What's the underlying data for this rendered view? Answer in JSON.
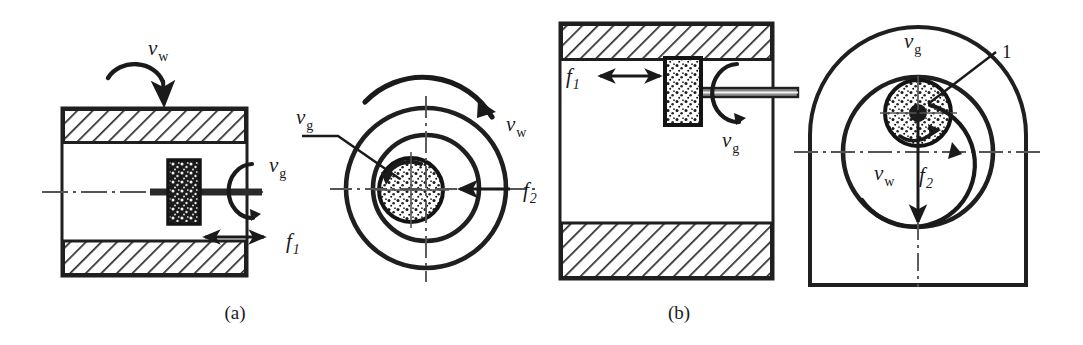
{
  "figure": {
    "colors": {
      "ink": "#1a1a1a",
      "line": "#222222",
      "hatch": "#2b2b2b",
      "background": "#ffffff",
      "centerline": "#555555",
      "grit": "#111111"
    }
  },
  "panel_a": {
    "caption": "(a)",
    "section_view": {
      "name": "workpiece-section-a",
      "labels": {
        "wheel_speed": "ν",
        "wheel_speed_sub": "w",
        "grind_speed": "ν",
        "grind_speed_sub": "g",
        "feed": "f",
        "feed_sub": "1"
      }
    },
    "end_view": {
      "name": "workpiece-end-view-a",
      "labels": {
        "grind_speed": "ν",
        "grind_speed_sub": "g",
        "wheel_speed": "ν",
        "wheel_speed_sub": "w",
        "feed": "f",
        "feed_sub": "2"
      }
    }
  },
  "panel_b": {
    "caption": "(b)",
    "section_view": {
      "name": "workpiece-section-b",
      "labels": {
        "feed": "f",
        "feed_sub": "1",
        "grind_speed": "ν",
        "grind_speed_sub": "g"
      }
    },
    "end_view": {
      "name": "workpiece-end-view-b",
      "labels": {
        "grind_speed": "ν",
        "grind_speed_sub": "g",
        "wheel_speed": "ν",
        "wheel_speed_sub": "w",
        "feed": "f",
        "feed_sub": "2",
        "callout": "1"
      }
    }
  }
}
